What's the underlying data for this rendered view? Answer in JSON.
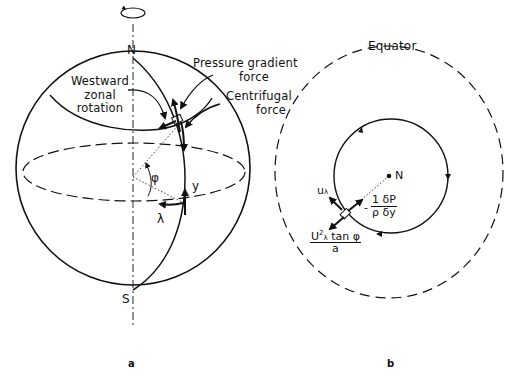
{
  "figure": {
    "panel_a": {
      "caption": "a",
      "pole_north": "N",
      "pole_south": "S",
      "labels": {
        "westward_line1": "Westward",
        "westward_line2": "zonal",
        "westward_line3": "rotation",
        "pressure_line1": "Pressure gradient",
        "pressure_line2": "force",
        "centrifugal_line1": "Centrifugal",
        "centrifugal_line2": "force",
        "latitude_symbol": "φ",
        "y_axis": "y",
        "longitude_symbol": "λ"
      }
    },
    "panel_b": {
      "caption": "b",
      "equator_label": "Equator",
      "pole_label": "N",
      "velocity_label": "u",
      "velocity_sub": "λ",
      "pressure_term": {
        "minus": "-",
        "numerator": "1 δP",
        "denominator": "ρ δy"
      },
      "centrifugal_term": {
        "numerator_base": "U",
        "numerator_sup": "2",
        "numerator_sub": "λ",
        "numerator_rest": "tan φ",
        "denominator": "a"
      }
    },
    "colors": {
      "ink": "#111111",
      "background": "#ffffff"
    }
  }
}
